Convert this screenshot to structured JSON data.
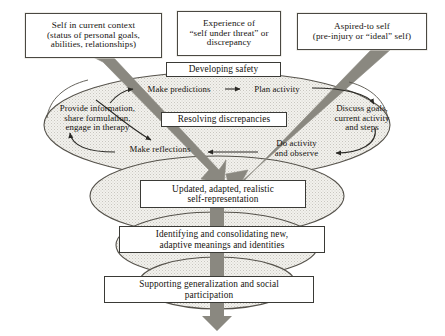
{
  "diagram": {
    "palette": {
      "band_arrow": "#8a8880",
      "ellipse_fill": "#efeeea",
      "ellipse_stroke": "#55524b",
      "box_border": "#3a3a36",
      "text": "#15130f",
      "background": "#ffffff"
    },
    "context_boxes": [
      {
        "id": "self-context",
        "text": "Self in current context\n(status of personal goals,\nabilities, relationships)"
      },
      {
        "id": "threat",
        "text": "Experience of\n“self under threat” or\ndiscrepancy"
      },
      {
        "id": "aspired",
        "text": "Aspired-to self\n(pre-injury or “ideal” self)"
      }
    ],
    "phase_boxes": [
      {
        "id": "developing-safety",
        "text": "Developing safety"
      },
      {
        "id": "resolving-discrepancies",
        "text": "Resolving discrepancies"
      },
      {
        "id": "updated-self",
        "text": "Updated, adapted, realistic\nself-representation"
      },
      {
        "id": "identifying-meanings",
        "text": "Identifying and consolidating new,\nadaptive meanings and identities"
      },
      {
        "id": "supporting-generalization",
        "text": "Supporting generalization and social\nparticipation"
      }
    ],
    "cycle_nodes": [
      {
        "id": "make-predictions",
        "text": "Make predictions"
      },
      {
        "id": "plan-activity",
        "text": "Plan activity"
      },
      {
        "id": "discuss-goals",
        "text": "Discuss goals,\ncurrent activity\nand steps"
      },
      {
        "id": "do-activity",
        "text": "Do activity\nand observe"
      },
      {
        "id": "make-reflections",
        "text": "Make reflections"
      },
      {
        "id": "provide-information",
        "text": "Provide information,\nshare formulation,\nengage in therapy"
      }
    ]
  }
}
